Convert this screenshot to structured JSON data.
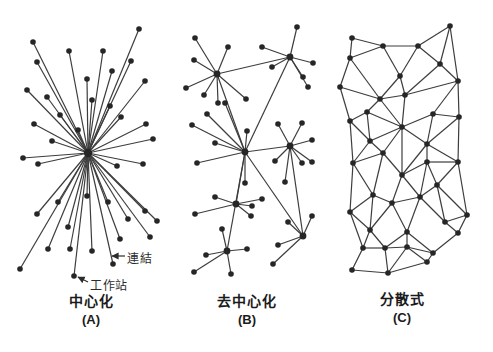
{
  "diagram": {
    "background": "#ffffff",
    "node_color": "#262626",
    "line_color": "#3d3d3d",
    "node_radius": 2.8,
    "line_width": 1.2,
    "panels": [
      {
        "id": "centralized",
        "caption": "中心化",
        "letter": "(A)",
        "caption_x": 91,
        "caption_y": 294,
        "hub_indices": [
          0
        ],
        "hub_radius": 4.2,
        "nodes": [
          [
            88,
            153
          ],
          [
            33,
            42
          ],
          [
            37,
            62
          ],
          [
            27,
            90
          ],
          [
            47,
            97
          ],
          [
            69,
            51
          ],
          [
            87,
            79
          ],
          [
            92,
            100
          ],
          [
            103,
            51
          ],
          [
            112,
            71
          ],
          [
            110,
            106
          ],
          [
            131,
            61
          ],
          [
            139,
            29
          ],
          [
            145,
            81
          ],
          [
            121,
            117
          ],
          [
            146,
            124
          ],
          [
            34,
            124
          ],
          [
            52,
            141
          ],
          [
            153,
            139
          ],
          [
            23,
            158
          ],
          [
            38,
            164
          ],
          [
            117,
            166
          ],
          [
            143,
            164
          ],
          [
            37,
            214
          ],
          [
            58,
            202
          ],
          [
            87,
            196
          ],
          [
            108,
            202
          ],
          [
            128,
            219
          ],
          [
            145,
            211
          ],
          [
            157,
            221
          ],
          [
            68,
            227
          ],
          [
            48,
            249
          ],
          [
            70,
            249
          ],
          [
            92,
            251
          ],
          [
            113,
            264
          ],
          [
            74,
            276
          ],
          [
            20,
            269
          ],
          [
            120,
            239
          ],
          [
            150,
            237
          ],
          [
            60,
            115
          ],
          [
            78,
            130
          ]
        ],
        "edges": [
          [
            0,
            1
          ],
          [
            0,
            2
          ],
          [
            0,
            3
          ],
          [
            0,
            4
          ],
          [
            0,
            5
          ],
          [
            0,
            6
          ],
          [
            0,
            7
          ],
          [
            0,
            8
          ],
          [
            0,
            9
          ],
          [
            0,
            10
          ],
          [
            0,
            11
          ],
          [
            0,
            12
          ],
          [
            0,
            13
          ],
          [
            0,
            14
          ],
          [
            0,
            15
          ],
          [
            0,
            16
          ],
          [
            0,
            17
          ],
          [
            0,
            18
          ],
          [
            0,
            19
          ],
          [
            0,
            20
          ],
          [
            0,
            21
          ],
          [
            0,
            22
          ],
          [
            0,
            23
          ],
          [
            0,
            24
          ],
          [
            0,
            25
          ],
          [
            0,
            26
          ],
          [
            0,
            27
          ],
          [
            0,
            28
          ],
          [
            0,
            29
          ],
          [
            0,
            30
          ],
          [
            0,
            31
          ],
          [
            0,
            32
          ],
          [
            0,
            33
          ],
          [
            0,
            34
          ],
          [
            0,
            35
          ],
          [
            0,
            36
          ],
          [
            0,
            37
          ],
          [
            0,
            38
          ],
          [
            0,
            39
          ],
          [
            0,
            40
          ]
        ]
      },
      {
        "id": "decentralized",
        "caption": "去中心化",
        "letter": "(B)",
        "caption_x": 247,
        "caption_y": 294,
        "hub_indices": [
          0,
          1,
          2,
          3,
          4,
          5,
          6
        ],
        "hub_radius": 3.4,
        "nodes": [
          [
            217,
            74
          ],
          [
            290,
            57
          ],
          [
            245,
            152
          ],
          [
            290,
            146
          ],
          [
            236,
            204
          ],
          [
            227,
            251
          ],
          [
            303,
            236
          ],
          [
            195,
            38
          ],
          [
            228,
            47
          ],
          [
            194,
            60
          ],
          [
            186,
            88
          ],
          [
            204,
            95
          ],
          [
            218,
            103
          ],
          [
            246,
            99
          ],
          [
            297,
            27
          ],
          [
            262,
            47
          ],
          [
            313,
            63
          ],
          [
            272,
            67
          ],
          [
            303,
            77
          ],
          [
            308,
            87
          ],
          [
            225,
            103
          ],
          [
            207,
            114
          ],
          [
            192,
            125
          ],
          [
            215,
            143
          ],
          [
            197,
            163
          ],
          [
            247,
            131
          ],
          [
            245,
            183
          ],
          [
            278,
            124
          ],
          [
            302,
            123
          ],
          [
            312,
            140
          ],
          [
            312,
            162
          ],
          [
            302,
            163
          ],
          [
            275,
            161
          ],
          [
            285,
            182
          ],
          [
            215,
            197
          ],
          [
            195,
            214
          ],
          [
            252,
            206
          ],
          [
            251,
            216
          ],
          [
            262,
            199
          ],
          [
            222,
            229
          ],
          [
            206,
            255
          ],
          [
            247,
            249
          ],
          [
            194,
            272
          ],
          [
            231,
            274
          ],
          [
            288,
            222
          ],
          [
            312,
            216
          ],
          [
            278,
            245
          ],
          [
            273,
            264
          ]
        ],
        "edges": [
          [
            0,
            1
          ],
          [
            0,
            2
          ],
          [
            1,
            2
          ],
          [
            2,
            3
          ],
          [
            2,
            4
          ],
          [
            2,
            5
          ],
          [
            2,
            6
          ],
          [
            3,
            6
          ],
          [
            0,
            7
          ],
          [
            0,
            8
          ],
          [
            0,
            9
          ],
          [
            0,
            10
          ],
          [
            0,
            11
          ],
          [
            0,
            12
          ],
          [
            0,
            13
          ],
          [
            1,
            14
          ],
          [
            1,
            15
          ],
          [
            1,
            16
          ],
          [
            1,
            17
          ],
          [
            1,
            18
          ],
          [
            1,
            19
          ],
          [
            2,
            20
          ],
          [
            2,
            21
          ],
          [
            2,
            22
          ],
          [
            2,
            23
          ],
          [
            2,
            24
          ],
          [
            2,
            25
          ],
          [
            2,
            26
          ],
          [
            3,
            27
          ],
          [
            3,
            28
          ],
          [
            3,
            29
          ],
          [
            3,
            30
          ],
          [
            3,
            31
          ],
          [
            3,
            32
          ],
          [
            3,
            33
          ],
          [
            4,
            34
          ],
          [
            4,
            35
          ],
          [
            4,
            36
          ],
          [
            4,
            37
          ],
          [
            4,
            38
          ],
          [
            5,
            39
          ],
          [
            5,
            40
          ],
          [
            5,
            41
          ],
          [
            5,
            42
          ],
          [
            5,
            43
          ],
          [
            6,
            44
          ],
          [
            6,
            45
          ],
          [
            6,
            46
          ],
          [
            6,
            47
          ]
        ]
      },
      {
        "id": "distributed",
        "caption": "分散式",
        "letter": "(C)",
        "caption_x": 402,
        "caption_y": 292,
        "hub_indices": [],
        "hub_radius": 2.8,
        "nodes": [
          [
            352,
            38
          ],
          [
            383,
            46
          ],
          [
            418,
            46
          ],
          [
            450,
            26
          ],
          [
            350,
            58
          ],
          [
            400,
            76
          ],
          [
            440,
            64
          ],
          [
            340,
            87
          ],
          [
            380,
            99
          ],
          [
            405,
            95
          ],
          [
            458,
            81
          ],
          [
            350,
            121
          ],
          [
            367,
            112
          ],
          [
            402,
            127
          ],
          [
            433,
            114
          ],
          [
            459,
            117
          ],
          [
            370,
            141
          ],
          [
            427,
            144
          ],
          [
            353,
            163
          ],
          [
            383,
            153
          ],
          [
            402,
            175
          ],
          [
            427,
            162
          ],
          [
            458,
            162
          ],
          [
            373,
            195
          ],
          [
            392,
            203
          ],
          [
            420,
            197
          ],
          [
            437,
            185
          ],
          [
            350,
            212
          ],
          [
            445,
            222
          ],
          [
            467,
            215
          ],
          [
            370,
            230
          ],
          [
            407,
            232
          ],
          [
            458,
            233
          ],
          [
            363,
            248
          ],
          [
            385,
            248
          ],
          [
            407,
            247
          ],
          [
            433,
            253
          ],
          [
            352,
            270
          ],
          [
            388,
            273
          ],
          [
            427,
            262
          ]
        ],
        "edges": [
          [
            0,
            1
          ],
          [
            1,
            2
          ],
          [
            2,
            3
          ],
          [
            0,
            4
          ],
          [
            1,
            4
          ],
          [
            1,
            5
          ],
          [
            2,
            5
          ],
          [
            2,
            6
          ],
          [
            3,
            6
          ],
          [
            3,
            10
          ],
          [
            4,
            7
          ],
          [
            4,
            8
          ],
          [
            5,
            8
          ],
          [
            5,
            9
          ],
          [
            6,
            9
          ],
          [
            6,
            10
          ],
          [
            7,
            8
          ],
          [
            8,
            9
          ],
          [
            9,
            10
          ],
          [
            7,
            11
          ],
          [
            8,
            12
          ],
          [
            8,
            13
          ],
          [
            9,
            13
          ],
          [
            10,
            14
          ],
          [
            10,
            15
          ],
          [
            11,
            12
          ],
          [
            12,
            13
          ],
          [
            13,
            14
          ],
          [
            14,
            15
          ],
          [
            11,
            16
          ],
          [
            12,
            16
          ],
          [
            13,
            16
          ],
          [
            13,
            17
          ],
          [
            14,
            17
          ],
          [
            15,
            17
          ],
          [
            15,
            22
          ],
          [
            13,
            19
          ],
          [
            13,
            20
          ],
          [
            16,
            18
          ],
          [
            16,
            19
          ],
          [
            17,
            20
          ],
          [
            17,
            21
          ],
          [
            17,
            22
          ],
          [
            18,
            19
          ],
          [
            19,
            20
          ],
          [
            20,
            21
          ],
          [
            21,
            22
          ],
          [
            11,
            18
          ],
          [
            18,
            23
          ],
          [
            19,
            23
          ],
          [
            20,
            24
          ],
          [
            20,
            25
          ],
          [
            21,
            25
          ],
          [
            21,
            26
          ],
          [
            22,
            26
          ],
          [
            22,
            29
          ],
          [
            23,
            24
          ],
          [
            24,
            25
          ],
          [
            25,
            26
          ],
          [
            18,
            27
          ],
          [
            23,
            27
          ],
          [
            26,
            28
          ],
          [
            26,
            29
          ],
          [
            23,
            30
          ],
          [
            24,
            30
          ],
          [
            24,
            31
          ],
          [
            25,
            31
          ],
          [
            25,
            28
          ],
          [
            27,
            30
          ],
          [
            27,
            33
          ],
          [
            28,
            29
          ],
          [
            28,
            32
          ],
          [
            29,
            32
          ],
          [
            30,
            33
          ],
          [
            30,
            34
          ],
          [
            31,
            34
          ],
          [
            31,
            35
          ],
          [
            31,
            36
          ],
          [
            32,
            36
          ],
          [
            33,
            34
          ],
          [
            34,
            35
          ],
          [
            35,
            36
          ],
          [
            33,
            37
          ],
          [
            34,
            38
          ],
          [
            35,
            38
          ],
          [
            35,
            39
          ],
          [
            36,
            39
          ],
          [
            37,
            38
          ],
          [
            38,
            39
          ]
        ]
      }
    ],
    "annotations": [
      {
        "id": "link",
        "text": "連結",
        "label_x": 127,
        "label_y": 249,
        "arrow_from": [
          125,
          256
        ],
        "arrow_to": [
          112,
          256
        ]
      },
      {
        "id": "workstation",
        "text": "工作站",
        "label_x": 90,
        "label_y": 276,
        "arrow_from": [
          88,
          282
        ],
        "arrow_to": [
          78,
          277
        ]
      }
    ]
  }
}
